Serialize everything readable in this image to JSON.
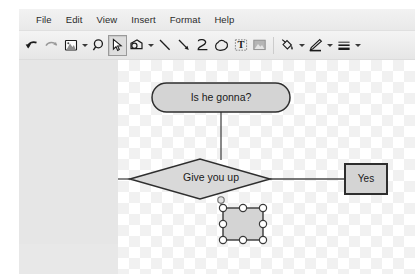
{
  "window": {
    "bg_color": "#eeeeee"
  },
  "menubar": {
    "items": [
      {
        "label": "File",
        "name": "menu-file"
      },
      {
        "label": "Edit",
        "name": "menu-edit"
      },
      {
        "label": "View",
        "name": "menu-view"
      },
      {
        "label": "Insert",
        "name": "menu-insert"
      },
      {
        "label": "Format",
        "name": "menu-format"
      },
      {
        "label": "Help",
        "name": "menu-help"
      }
    ]
  },
  "toolbar": {
    "buttons": [
      {
        "icon": "undo-icon",
        "tooltip": "Undo",
        "active": false,
        "caret": false
      },
      {
        "icon": "redo-icon",
        "tooltip": "Redo",
        "active": false,
        "caret": false
      },
      {
        "icon": "image-icon",
        "tooltip": "Image",
        "active": false,
        "caret": true
      },
      {
        "icon": "magnifier-icon",
        "tooltip": "Zoom",
        "active": false,
        "caret": false
      },
      {
        "icon": "cursor-select-icon",
        "tooltip": "Select",
        "active": true,
        "caret": false
      },
      {
        "icon": "shape-icon",
        "tooltip": "Shape",
        "active": false,
        "caret": true
      },
      {
        "icon": "line-icon",
        "tooltip": "Line",
        "active": false,
        "caret": false
      },
      {
        "icon": "arrow-icon",
        "tooltip": "Arrow",
        "active": false,
        "caret": false
      },
      {
        "icon": "curve-icon",
        "tooltip": "Curve",
        "active": false,
        "caret": false
      },
      {
        "icon": "freeform-cloud-icon",
        "tooltip": "Freeform",
        "active": false,
        "caret": false
      },
      {
        "icon": "text-box-icon",
        "tooltip": "Text box",
        "active": false,
        "caret": false
      },
      {
        "icon": "image-fill-icon",
        "tooltip": "Image",
        "active": false,
        "caret": false
      },
      {
        "icon": "paint-bucket-icon",
        "tooltip": "Fill color",
        "active": false,
        "caret": true
      },
      {
        "icon": "pencil-icon",
        "tooltip": "Line color",
        "active": false,
        "caret": true
      },
      {
        "icon": "line-weight-icon",
        "tooltip": "Line weight",
        "active": false,
        "caret": true
      }
    ]
  },
  "canvas": {
    "shapes": [
      {
        "name": "shape-rounded-rect-is-he-gonna",
        "type": "rounded-rect",
        "label": "Is he gonna?",
        "x": 34,
        "y": 23,
        "w": 138,
        "h": 29,
        "fill": "#d4d4d4",
        "stroke": "#333333",
        "selected": false
      },
      {
        "name": "shape-diamond-give-you-up",
        "type": "diamond",
        "label": "Give you up",
        "x": 12,
        "y": 99,
        "w": 140,
        "h": 40,
        "fill": "#d9d9d9",
        "stroke": "#333333",
        "selected": false
      },
      {
        "name": "shape-rect-yes",
        "type": "rect",
        "label": "Yes",
        "x": 226,
        "y": 104,
        "w": 42,
        "h": 30,
        "fill": "#d4d4d4",
        "stroke": "#333333",
        "selected": false
      },
      {
        "name": "shape-rect-selected",
        "type": "rect",
        "label": "",
        "x": 105,
        "y": 148,
        "w": 40,
        "h": 32,
        "fill": "#d4d4d4",
        "stroke": "#333333",
        "selected": true
      }
    ],
    "connectors": [
      {
        "name": "connector-rounded-rect-to-diamond",
        "from": "shape-rounded-rect-is-he-gonna",
        "to": "shape-diamond-give-you-up",
        "x1": 103,
        "y1": 52,
        "x2": 103,
        "y2": 99
      },
      {
        "name": "connector-diamond-to-yes",
        "from": "shape-diamond-give-you-up",
        "to": "shape-rect-yes",
        "x1": 152,
        "y1": 119,
        "x2": 226,
        "y2": 119
      },
      {
        "name": "connector-diamond-left-stub",
        "from": "shape-diamond-give-you-up",
        "to": "",
        "x1": 12,
        "y1": 119,
        "x2": 0,
        "y2": 119
      },
      {
        "name": "connector-diamond-to-selected",
        "from": "shape-diamond-give-you-up",
        "to": "shape-rect-selected",
        "x1": 103,
        "y1": 139,
        "x2": 103,
        "y2": 148
      }
    ],
    "anchor_points": [
      {
        "name": "anchor-point-diamond-bottom",
        "x": 103,
        "y": 140
      }
    ],
    "selection_handles": {
      "name": "selection-handles",
      "fill": "#ffffff",
      "stroke": "#3a3a3a",
      "radius": 3.6,
      "points": [
        {
          "x": 105,
          "y": 148
        },
        {
          "x": 125,
          "y": 148
        },
        {
          "x": 145,
          "y": 148
        },
        {
          "x": 105,
          "y": 164
        },
        {
          "x": 145,
          "y": 164
        },
        {
          "x": 105,
          "y": 180
        },
        {
          "x": 125,
          "y": 180
        },
        {
          "x": 145,
          "y": 180
        }
      ]
    }
  }
}
